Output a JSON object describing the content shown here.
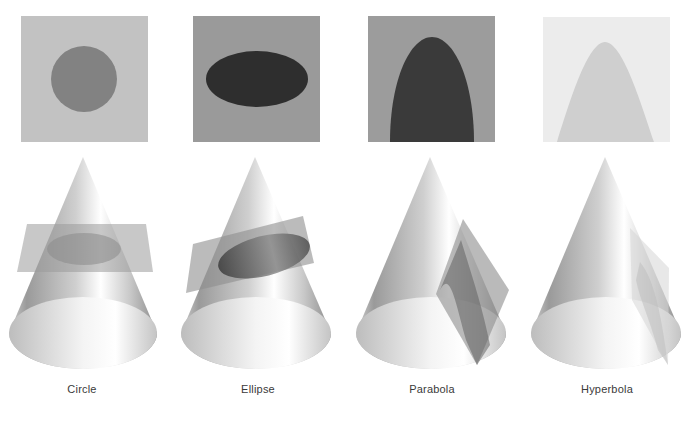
{
  "figure": {
    "background": "#ffffff",
    "sections": [
      {
        "id": "circle",
        "label": "Circle",
        "panel": {
          "bg": "#c2c2c2",
          "shape": "circle",
          "shape_color": "#828282"
        },
        "plane": "horizontal"
      },
      {
        "id": "ellipse",
        "label": "Ellipse",
        "panel": {
          "bg": "#9a9a9a",
          "shape": "ellipse",
          "shape_color": "#2e2e2e"
        },
        "plane": "tilted"
      },
      {
        "id": "parabola",
        "label": "Parabola",
        "panel": {
          "bg": "#9c9c9c",
          "shape": "parabola",
          "shape_color": "#3a3a3a"
        },
        "plane": "parallel-to-side"
      },
      {
        "id": "hyperbola",
        "label": "Hyperbola",
        "panel": {
          "bg": "#ececec",
          "shape": "hyperbola",
          "shape_color": "#cfcfcf"
        },
        "plane": "vertical"
      }
    ]
  }
}
